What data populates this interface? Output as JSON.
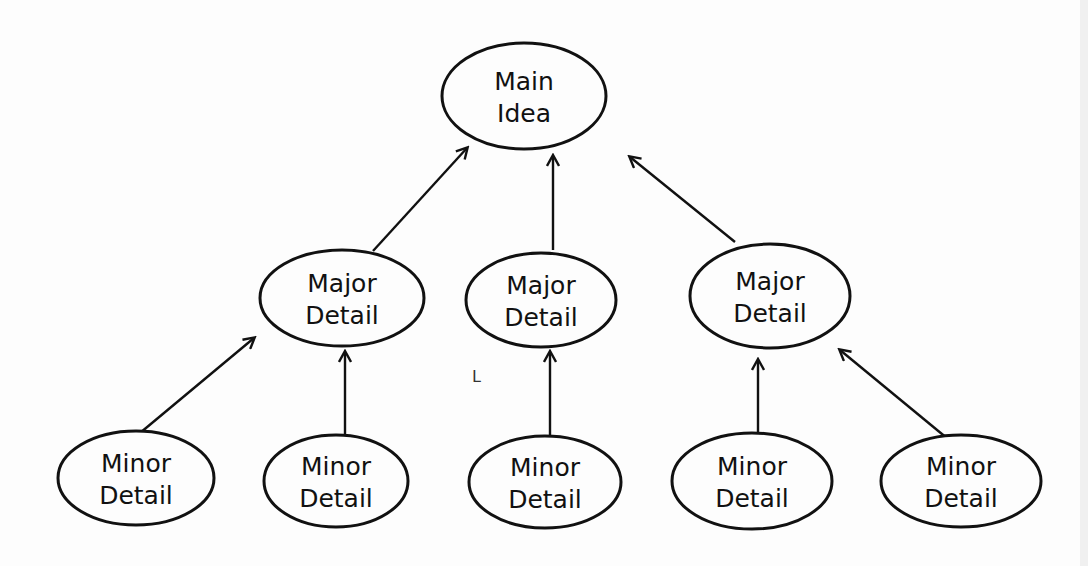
{
  "diagram": {
    "type": "hierarchy",
    "nodes": [
      {
        "id": "main",
        "line1": "Main",
        "line2": "Idea",
        "cx": 524,
        "cy": 96,
        "rx": 82,
        "ry": 53
      },
      {
        "id": "major1",
        "line1": "Major",
        "line2": "Detail",
        "cx": 342,
        "cy": 298,
        "rx": 82,
        "ry": 48
      },
      {
        "id": "major2",
        "line1": "Major",
        "line2": "Detail",
        "cx": 541,
        "cy": 300,
        "rx": 75,
        "ry": 47
      },
      {
        "id": "major3",
        "line1": "Major",
        "line2": "Detail",
        "cx": 770,
        "cy": 296,
        "rx": 80,
        "ry": 52
      },
      {
        "id": "minor1",
        "line1": "Minor",
        "line2": "Detail",
        "cx": 136,
        "cy": 478,
        "rx": 78,
        "ry": 47
      },
      {
        "id": "minor2",
        "line1": "Minor",
        "line2": "Detail",
        "cx": 336,
        "cy": 481,
        "rx": 72,
        "ry": 46
      },
      {
        "id": "minor3",
        "line1": "Minor",
        "line2": "Detail",
        "cx": 545,
        "cy": 482,
        "rx": 76,
        "ry": 46
      },
      {
        "id": "minor4",
        "line1": "Minor",
        "line2": "Detail",
        "cx": 752,
        "cy": 481,
        "rx": 80,
        "ry": 48
      },
      {
        "id": "minor5",
        "line1": "Minor",
        "line2": "Detail",
        "cx": 961,
        "cy": 481,
        "rx": 80,
        "ry": 46
      }
    ],
    "edges": [
      {
        "from": "major1",
        "to": "main",
        "x1": 373,
        "y1": 251,
        "x2": 467,
        "y2": 148
      },
      {
        "from": "major2",
        "to": "main",
        "x1": 553,
        "y1": 250,
        "x2": 553,
        "y2": 156
      },
      {
        "from": "major3",
        "to": "main",
        "x1": 735,
        "y1": 242,
        "x2": 630,
        "y2": 157
      },
      {
        "from": "minor1",
        "to": "major1",
        "x1": 140,
        "y1": 433,
        "x2": 254,
        "y2": 338
      },
      {
        "from": "minor2",
        "to": "major1",
        "x1": 345,
        "y1": 436,
        "x2": 345,
        "y2": 352
      },
      {
        "from": "minor3",
        "to": "major2",
        "x1": 550,
        "y1": 436,
        "x2": 550,
        "y2": 352
      },
      {
        "from": "minor4",
        "to": "major3",
        "x1": 758,
        "y1": 433,
        "x2": 758,
        "y2": 360
      },
      {
        "from": "minor5",
        "to": "major3",
        "x1": 948,
        "y1": 439,
        "x2": 840,
        "y2": 350
      }
    ],
    "stray_mark": {
      "text": "L",
      "x": 472,
      "y": 382
    }
  }
}
